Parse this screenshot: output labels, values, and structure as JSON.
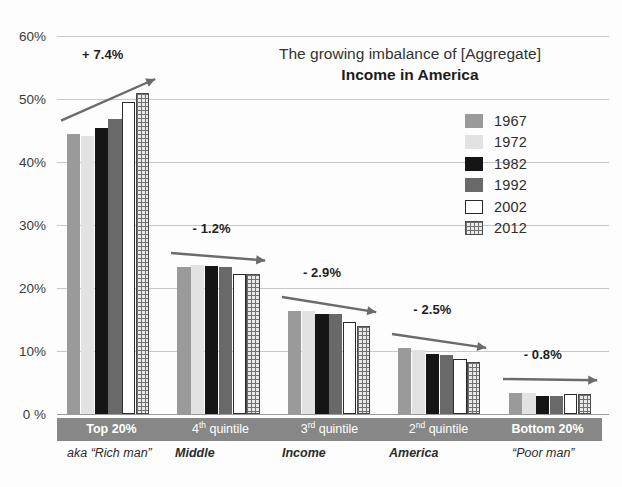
{
  "chart_data": {
    "type": "bar",
    "title": "The growing imbalance of [Aggregate] Income in America",
    "title_line1": "The growing imbalance of [Aggregate]",
    "title_line2": "Income in America",
    "xlabel": "",
    "ylabel": "",
    "ylim": [
      0,
      60
    ],
    "grid": true,
    "legend_position": "inside-top-right",
    "ytick_labels": [
      "60%",
      "50%",
      "40%",
      "30%",
      "20%",
      "10%",
      "0 %"
    ],
    "ytick_values": [
      60,
      50,
      40,
      30,
      20,
      10,
      0
    ],
    "categories": [
      "Top 20%",
      "4th quintile",
      "3rd quintile",
      "2nd quintile",
      "Bottom 20%"
    ],
    "category_sublabels": [
      "aka “Rich man”",
      "Middle",
      "Income",
      "America",
      "“Poor man”"
    ],
    "series": [
      {
        "name": "1967",
        "color": "#9a9a9a",
        "values": [
          44.4,
          23.4,
          16.4,
          10.5,
          3.4
        ]
      },
      {
        "name": "1972",
        "color": "#e2e2e2",
        "values": [
          44.2,
          23.6,
          16.4,
          10.2,
          3.3
        ]
      },
      {
        "name": "1982",
        "color": "#151515",
        "values": [
          45.4,
          23.5,
          15.9,
          9.5,
          2.9
        ]
      },
      {
        "name": "1992",
        "color": "#696969",
        "values": [
          46.9,
          23.3,
          15.8,
          9.3,
          2.9
        ]
      },
      {
        "name": "2002",
        "color": "#ffffff",
        "values": [
          49.6,
          22.2,
          14.6,
          8.7,
          3.1
        ]
      },
      {
        "name": "2012",
        "color": "#e9e9e9",
        "values": [
          51.0,
          22.2,
          14.0,
          8.3,
          3.2
        ]
      }
    ],
    "annotations": [
      {
        "label": "+ 7.4%",
        "category": "Top 20%",
        "direction": "up"
      },
      {
        "label": "- 1.2%",
        "category": "4th quintile",
        "direction": "down"
      },
      {
        "label": "- 2.9%",
        "category": "3rd quintile",
        "direction": "down"
      },
      {
        "label": "- 2.5%",
        "category": "2nd quintile",
        "direction": "down"
      },
      {
        "label": "- 0.8%",
        "category": "Bottom 20%",
        "direction": "down"
      }
    ]
  },
  "legend": {
    "entries": [
      {
        "label": "1967",
        "swatch": "swatch-1967"
      },
      {
        "label": "1972",
        "swatch": "swatch-1972"
      },
      {
        "label": "1982",
        "swatch": "swatch-1982"
      },
      {
        "label": "1992",
        "swatch": "swatch-1992"
      },
      {
        "label": "2002",
        "swatch": "swatch-2002"
      },
      {
        "label": "2012",
        "swatch": "swatch-2012"
      }
    ]
  },
  "axis_band": {
    "cells": [
      {
        "text": "Top 20%",
        "bold": true,
        "sup": ""
      },
      {
        "text": " quintile",
        "bold": false,
        "prefix": "4",
        "sup": "th"
      },
      {
        "text": " quintile",
        "bold": false,
        "prefix": "3",
        "sup": "rd"
      },
      {
        "text": " quintile",
        "bold": false,
        "prefix": "2",
        "sup": "nd"
      },
      {
        "text": "Bottom 20%",
        "bold": true,
        "sup": ""
      }
    ]
  },
  "sublabels": {
    "items": [
      {
        "text": "aka “Rich man”",
        "bold": false
      },
      {
        "text": "Middle",
        "bold": true
      },
      {
        "text": "Income",
        "bold": true
      },
      {
        "text": "America",
        "bold": true
      },
      {
        "text": "“Poor man”",
        "bold": false
      }
    ]
  },
  "colors": {
    "grid": "#c8c8c8",
    "axis_band_bg": "#878787",
    "annotation_arrow": "#6b6b6b",
    "text": "#2b2b2b"
  }
}
